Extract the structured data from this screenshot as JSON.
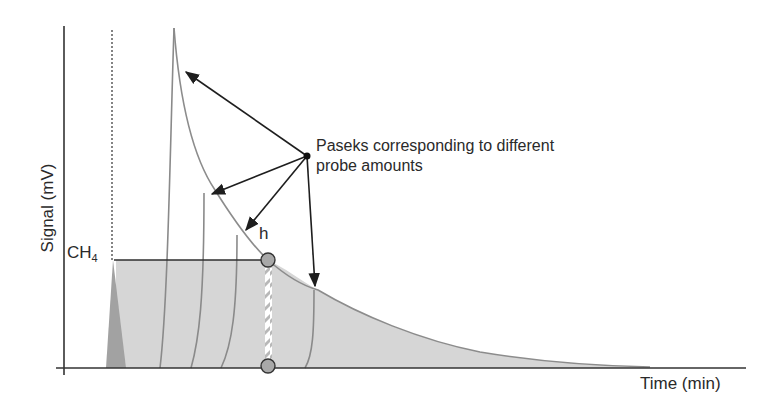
{
  "diagram": {
    "axes": {
      "y_label": "Signal (mV)",
      "x_label": "Time (min)"
    },
    "labels": {
      "methane": "CH",
      "methane_subscript": "4",
      "height_marker": "h",
      "annotation_line1": "Paseks corresponding to different",
      "annotation_line2": "probe amounts"
    },
    "colors": {
      "fill": "#d4d4d4",
      "curve": "#8a8a8a",
      "axis": "#333333",
      "marker": "#a8a8a8",
      "dark_peak": "#9a9a9a"
    },
    "elements": {
      "peaks_count": 5,
      "arrows_count": 4,
      "markers_count": 2
    }
  }
}
